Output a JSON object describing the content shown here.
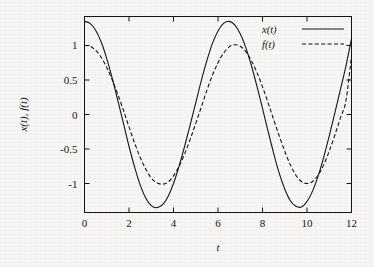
{
  "figure": {
    "type": "line-plot",
    "background_color": "#f7f6f4",
    "ink_color": "#141414"
  },
  "chart_data": {
    "type": "line",
    "title": "",
    "xlabel": "t",
    "ylabel": "x(t), f(t)",
    "xlim": [
      0,
      12
    ],
    "ylim": [
      -1.42,
      1.42
    ],
    "xticks": [
      0,
      2,
      4,
      6,
      8,
      10,
      12
    ],
    "xtick_labels": [
      "0",
      "2",
      "4",
      "6",
      "8",
      "10",
      "12"
    ],
    "yticks": [
      1,
      0.5,
      0,
      -0.5,
      -1
    ],
    "ytick_labels": [
      "1",
      "0.5",
      "0",
      "-0.5",
      "-1"
    ],
    "grid": false,
    "legend_position": "top-right",
    "series": [
      {
        "name": "x(t)",
        "style": "solid",
        "color": "#141414",
        "amplitude": 1.35,
        "period": 6.283,
        "phase": 0.0,
        "x": [
          0,
          0.25,
          0.5,
          0.75,
          1,
          1.25,
          1.5,
          1.75,
          2,
          2.25,
          2.5,
          2.75,
          3,
          3.25,
          3.5,
          3.75,
          4,
          4.25,
          4.5,
          4.75,
          5,
          5.25,
          5.5,
          5.75,
          6,
          6.25,
          6.5,
          6.75,
          7,
          7.25,
          7.5,
          7.75,
          8,
          8.25,
          8.5,
          8.75,
          9,
          9.25,
          9.5,
          9.75,
          10,
          10.25,
          10.5,
          10.75,
          11,
          11.25,
          11.5,
          11.75,
          12
        ],
        "y": [
          1.35,
          1.32,
          1.22,
          1.05,
          0.81,
          0.52,
          0.2,
          -0.13,
          -0.46,
          -0.76,
          -1.02,
          -1.21,
          -1.32,
          -1.35,
          -1.31,
          -1.19,
          -1.0,
          -0.75,
          -0.46,
          -0.15,
          0.17,
          0.49,
          0.78,
          1.03,
          1.21,
          1.32,
          1.35,
          1.3,
          1.17,
          0.97,
          0.71,
          0.41,
          0.09,
          -0.24,
          -0.56,
          -0.85,
          -1.08,
          -1.25,
          -1.33,
          -1.34,
          -1.26,
          -1.11,
          -0.89,
          -0.62,
          -0.31,
          0.02,
          0.36,
          0.7,
          1.1
        ]
      },
      {
        "name": "f(t)",
        "style": "dashed",
        "color": "#141414",
        "amplitude": 1.0,
        "period": 6.283,
        "phase": 0.0,
        "x": [
          0,
          0.25,
          0.5,
          0.75,
          1,
          1.25,
          1.5,
          1.75,
          2,
          2.25,
          2.5,
          2.75,
          3,
          3.25,
          3.5,
          3.75,
          4,
          4.25,
          4.5,
          4.75,
          5,
          5.25,
          5.5,
          5.75,
          6,
          6.25,
          6.5,
          6.75,
          7,
          7.25,
          7.5,
          7.75,
          8,
          8.25,
          8.5,
          8.75,
          9,
          9.25,
          9.5,
          9.75,
          10,
          10.25,
          10.5,
          10.75,
          11,
          11.25,
          11.5,
          11.75,
          12
        ],
        "y": [
          1.0,
          0.99,
          0.93,
          0.83,
          0.68,
          0.5,
          0.29,
          0.06,
          -0.18,
          -0.41,
          -0.62,
          -0.79,
          -0.92,
          -0.99,
          -1.01,
          -0.98,
          -0.89,
          -0.75,
          -0.57,
          -0.36,
          -0.13,
          0.11,
          0.35,
          0.57,
          0.75,
          0.89,
          0.98,
          1.01,
          0.99,
          0.91,
          0.78,
          0.61,
          0.4,
          0.17,
          -0.07,
          -0.31,
          -0.53,
          -0.73,
          -0.88,
          -0.97,
          -1.0,
          -0.97,
          -0.88,
          -0.73,
          -0.53,
          -0.3,
          -0.05,
          0.2,
          0.85
        ]
      }
    ],
    "legend": [
      {
        "label": "x(t)",
        "style": "solid"
      },
      {
        "label": "f(t)",
        "style": "dashed"
      }
    ]
  }
}
